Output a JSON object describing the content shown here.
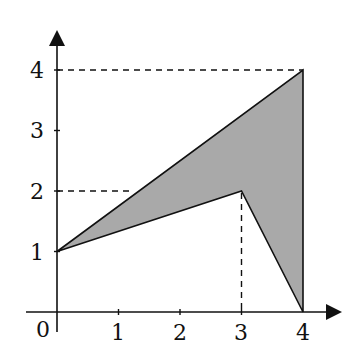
{
  "diagram": {
    "type": "coordinate-plane-polygon",
    "axes": {
      "x_ticks": [
        "0",
        "1",
        "2",
        "3",
        "4"
      ],
      "y_ticks": [
        "1",
        "2",
        "3",
        "4"
      ],
      "origin_label": "0"
    },
    "polygon": {
      "vertices": [
        [
          0,
          1
        ],
        [
          4,
          4
        ],
        [
          4,
          0
        ],
        [
          3,
          2
        ]
      ],
      "fill": "#a9a9a9",
      "stroke": "#111111"
    },
    "guide_lines": [
      {
        "from": [
          0,
          4
        ],
        "to": [
          4,
          4
        ],
        "style": "dashed"
      },
      {
        "from": [
          0,
          2
        ],
        "to": [
          1.2,
          2
        ],
        "style": "dashed"
      },
      {
        "from": [
          3,
          2
        ],
        "to": [
          3,
          0
        ],
        "style": "dashed"
      }
    ],
    "labels": {
      "x0": "0",
      "x1": "1",
      "x2": "2",
      "x3": "3",
      "x4": "4",
      "y1": "1",
      "y2": "2",
      "y3": "3",
      "y4": "4"
    }
  }
}
